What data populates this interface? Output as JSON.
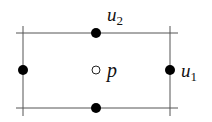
{
  "diagram": {
    "grid_lines": {
      "horizontal": [
        {
          "y": 33,
          "x1": 16,
          "x2": 178
        },
        {
          "y": 108,
          "x1": 16,
          "x2": 178
        }
      ],
      "vertical": [
        {
          "x": 23,
          "y1": 26,
          "y2": 116
        },
        {
          "x": 170,
          "y1": 26,
          "y2": 116
        }
      ],
      "color": "#555555"
    },
    "nodes": [
      {
        "id": "top",
        "x": 96,
        "y": 33,
        "filled": true
      },
      {
        "id": "bottom",
        "x": 96,
        "y": 108,
        "filled": true
      },
      {
        "id": "left",
        "x": 23,
        "y": 70,
        "filled": true
      },
      {
        "id": "right",
        "x": 170,
        "y": 70,
        "filled": true
      }
    ],
    "interior_point": {
      "x": 96,
      "y": 70,
      "filled": false
    },
    "labels": {
      "u2": {
        "base": "u",
        "sub": "2"
      },
      "u1": {
        "base": "u",
        "sub": "1"
      },
      "p": {
        "base": "p"
      }
    }
  }
}
